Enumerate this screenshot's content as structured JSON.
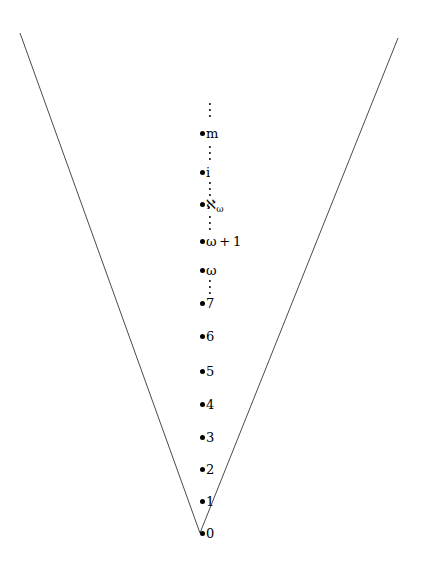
{
  "figure": {
    "width": 429,
    "height": 563,
    "background": "#ffffff",
    "ink_color": "#000000",
    "line_color": "#4a4a4a"
  },
  "cone": {
    "apex": {
      "x": 200,
      "y": 533
    },
    "left_top": {
      "x": 20,
      "y": 33
    },
    "right_top": {
      "x": 398,
      "y": 38
    },
    "stroke_width": 1
  },
  "column": {
    "bullet_x": 200,
    "nodes": [
      {
        "id": "node-m",
        "label_html": "m",
        "label_text": "m",
        "y": 133
      },
      {
        "id": "node-i",
        "label_html": "i",
        "label_text": "i",
        "y": 172
      },
      {
        "id": "node-aleph-w",
        "label_html": "&#8501;<span class=\"sub\">&#969;</span>",
        "label_text": "aleph-omega",
        "y": 205
      },
      {
        "id": "node-w-plus-1",
        "label_html": "&#969;<span class=\"op\">+</span>1",
        "label_text": "omega + 1",
        "y": 241
      },
      {
        "id": "node-w",
        "label_html": "&#969;",
        "label_text": "omega",
        "y": 270
      },
      {
        "id": "node-7",
        "label_html": "7",
        "label_text": "7",
        "y": 303
      },
      {
        "id": "node-6",
        "label_html": "6",
        "label_text": "6",
        "y": 336
      },
      {
        "id": "node-5",
        "label_html": "5",
        "label_text": "5",
        "y": 371
      },
      {
        "id": "node-4",
        "label_html": "4",
        "label_text": "4",
        "y": 404
      },
      {
        "id": "node-3",
        "label_html": "3",
        "label_text": "3",
        "y": 437
      },
      {
        "id": "node-2",
        "label_html": "2",
        "label_text": "2",
        "y": 469
      },
      {
        "id": "node-1",
        "label_html": "1",
        "label_text": "1",
        "y": 501
      },
      {
        "id": "node-0",
        "label_html": "0",
        "label_text": "0",
        "y": 533
      }
    ],
    "ellipses": [
      {
        "id": "vdots-above-m",
        "x": 210,
        "y": 110,
        "dots": 3
      },
      {
        "id": "vdots-m-i",
        "x": 210,
        "y": 153,
        "dots": 3
      },
      {
        "id": "vdots-i-aleph",
        "x": 210,
        "y": 189,
        "dots": 3
      },
      {
        "id": "vdots-aleph-w1",
        "x": 210,
        "y": 223,
        "dots": 3
      },
      {
        "id": "vdots-w-7",
        "x": 210,
        "y": 287,
        "dots": 3
      }
    ]
  }
}
